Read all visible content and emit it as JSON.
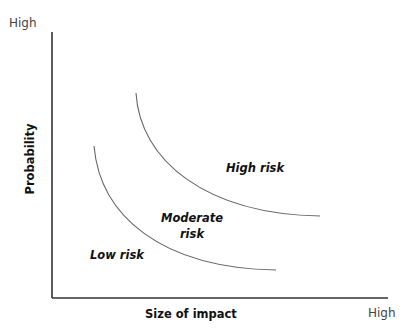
{
  "diagram": {
    "y_axis": {
      "label": "Probability",
      "end_label": "High"
    },
    "x_axis": {
      "label": "Size of impact",
      "end_label": "High"
    },
    "regions": [
      {
        "label": "Low risk"
      },
      {
        "label_line1": "Moderate",
        "label_line2": "risk"
      },
      {
        "label": "High risk"
      }
    ],
    "curves": [
      {
        "name": "low-moderate boundary",
        "color": "#666666"
      },
      {
        "name": "moderate-high boundary",
        "color": "#666666"
      }
    ],
    "axis_color": "#333333"
  }
}
